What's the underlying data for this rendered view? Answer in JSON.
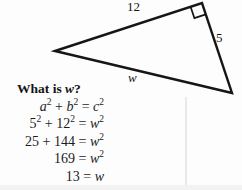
{
  "figure": {
    "labels": {
      "top_side": "12",
      "right_side": "5",
      "hypotenuse": "w"
    }
  },
  "question": {
    "segments": [
      {
        "t": "What is "
      },
      {
        "t": "w",
        "i": true
      },
      {
        "t": "?"
      }
    ]
  },
  "equations": [
    {
      "segments": [
        {
          "t": "a",
          "i": true
        },
        {
          "t": "2",
          "sup": true
        },
        {
          "t": " + "
        },
        {
          "t": "b",
          "i": true
        },
        {
          "t": "2",
          "sup": true
        },
        {
          "t": " = "
        },
        {
          "t": "c",
          "i": true
        },
        {
          "t": "2",
          "sup": true
        }
      ]
    },
    {
      "segments": [
        {
          "t": "5"
        },
        {
          "t": "2",
          "sup": true
        },
        {
          "t": " + "
        },
        {
          "t": "12"
        },
        {
          "t": "2",
          "sup": true
        },
        {
          "t": " = "
        },
        {
          "t": "w",
          "i": true
        },
        {
          "t": "2",
          "sup": true
        }
      ]
    },
    {
      "segments": [
        {
          "t": "25 + 144 = "
        },
        {
          "t": "w",
          "i": true
        },
        {
          "t": "2",
          "sup": true
        }
      ]
    },
    {
      "segments": [
        {
          "t": "169 = "
        },
        {
          "t": "w",
          "i": true
        },
        {
          "t": "2",
          "sup": true
        }
      ]
    },
    {
      "segments": [
        {
          "t": "13 = "
        },
        {
          "t": "w",
          "i": true
        }
      ]
    }
  ]
}
